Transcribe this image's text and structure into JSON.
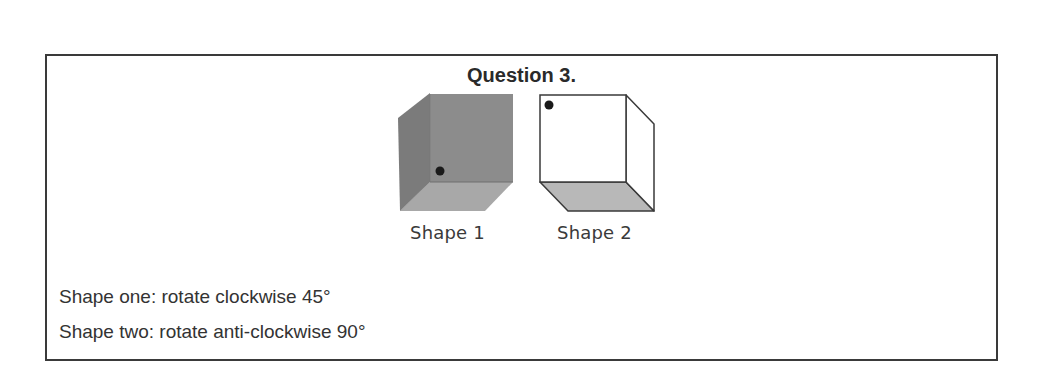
{
  "question": {
    "title": "Question 3.",
    "shapes": [
      {
        "label": "Shape 1",
        "style": "shaded cube, dark grey",
        "dot_position": "lower-left of back face"
      },
      {
        "label": "Shape 2",
        "style": "outlined cube, white faces with grey bottom",
        "dot_position": "upper-left of front face"
      }
    ],
    "instructions": [
      "Shape one: rotate clockwise 45°",
      "Shape two: rotate anti-clockwise 90°"
    ]
  },
  "colors": {
    "border": "#3a3a3a",
    "text": "#333333",
    "cube1_back": "#8a8a8a",
    "cube1_left": "#7a7a7a",
    "cube1_bottom": "#a6a6a6",
    "cube2_bottom": "#b5b5b5",
    "dot": "#1a1a1a"
  }
}
